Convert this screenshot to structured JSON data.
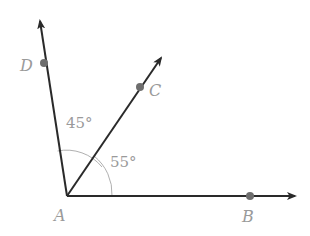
{
  "diagram": {
    "type": "geometry-angles",
    "vertex": {
      "label": "A",
      "x": 67,
      "y": 196
    },
    "rays": [
      {
        "name": "AD",
        "label": "D",
        "tip": [
          39,
          18
        ],
        "point": [
          44,
          63
        ]
      },
      {
        "name": "AC",
        "label": "C",
        "tip": [
          163,
          55
        ],
        "point": [
          140,
          87
        ]
      },
      {
        "name": "AB",
        "label": "B",
        "tip": [
          297,
          196
        ],
        "point": [
          250,
          196
        ]
      }
    ],
    "angles": [
      {
        "between": "DAC",
        "label": "45°"
      },
      {
        "between": "CAB",
        "label": "55°"
      }
    ],
    "colors": {
      "line": "#2a2a2a",
      "point": "#6e6e6e",
      "arc": "#b0b0b0",
      "text": "#9a9a9a"
    }
  },
  "labels": {
    "A": "A",
    "B": "B",
    "C": "C",
    "D": "D",
    "angle_dac": "45°",
    "angle_cab": "55°"
  }
}
